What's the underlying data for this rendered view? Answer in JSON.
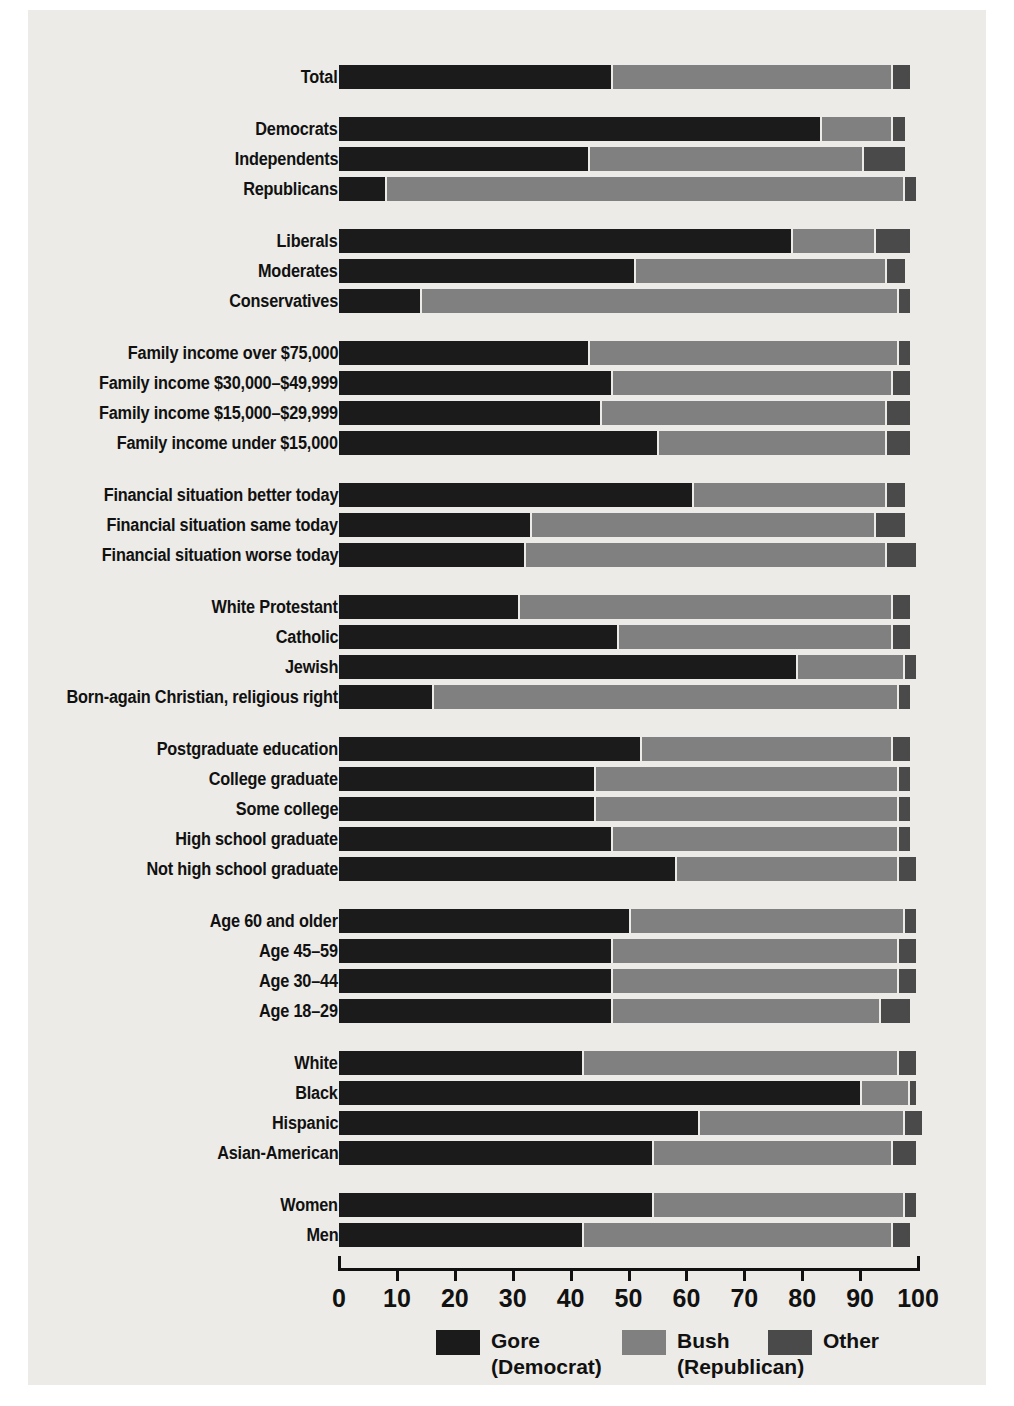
{
  "colors": {
    "gore": "#1b1b1b",
    "bush": "#808080",
    "other": "#4a4a4a",
    "page_background": "#ecebe7",
    "text": "#111111"
  },
  "legend": {
    "items": [
      {
        "name": "Gore",
        "sub": "(Democrat)",
        "color": "#1b1b1b"
      },
      {
        "name": "Bush",
        "sub": "(Republican)",
        "color": "#808080"
      },
      {
        "name": "Other",
        "sub": "",
        "color": "#4a4a4a"
      }
    ]
  },
  "axis": {
    "ticks": [
      "0",
      "10",
      "20",
      "30",
      "40",
      "50",
      "60",
      "70",
      "80",
      "90",
      "100"
    ],
    "min": 0,
    "max": 100
  },
  "chart_data": {
    "type": "bar",
    "orientation": "horizontal",
    "stacked": true,
    "title": "",
    "xlabel": "",
    "ylabel": "",
    "xlim": [
      0,
      100
    ],
    "grid": false,
    "legend_position": "bottom",
    "series": [
      {
        "name": "Gore (Democrat)",
        "color": "#1b1b1b"
      },
      {
        "name": "Bush (Republican)",
        "color": "#808080"
      },
      {
        "name": "Other",
        "color": "#4a4a4a"
      }
    ],
    "groups": [
      {
        "name": "total",
        "rows": [
          {
            "label": "Total",
            "values": [
              47,
              48,
              3
            ]
          }
        ]
      },
      {
        "name": "party",
        "rows": [
          {
            "label": "Democrats",
            "values": [
              83,
              12,
              2
            ]
          },
          {
            "label": "Independents",
            "values": [
              43,
              47,
              7
            ]
          },
          {
            "label": "Republicans",
            "values": [
              8,
              89,
              2
            ]
          }
        ]
      },
      {
        "name": "ideology",
        "rows": [
          {
            "label": "Liberals",
            "values": [
              78,
              14,
              6
            ]
          },
          {
            "label": "Moderates",
            "values": [
              51,
              43,
              3
            ]
          },
          {
            "label": "Conservatives",
            "values": [
              14,
              82,
              2
            ]
          }
        ]
      },
      {
        "name": "family-income",
        "rows": [
          {
            "label": "Family income over $75,000",
            "values": [
              43,
              53,
              2
            ]
          },
          {
            "label": "Family income $30,000–$49,999",
            "values": [
              47,
              48,
              3
            ]
          },
          {
            "label": "Family income $15,000–$29,999",
            "values": [
              45,
              49,
              4
            ]
          },
          {
            "label": "Family income under $15,000",
            "values": [
              55,
              39,
              4
            ]
          }
        ]
      },
      {
        "name": "financial-situation",
        "rows": [
          {
            "label": "Financial situation better today",
            "values": [
              61,
              33,
              3
            ]
          },
          {
            "label": "Financial situation same today",
            "values": [
              33,
              59,
              5
            ]
          },
          {
            "label": "Financial situation worse today",
            "values": [
              32,
              62,
              5
            ]
          }
        ]
      },
      {
        "name": "religion",
        "rows": [
          {
            "label": "White Protestant",
            "values": [
              31,
              64,
              3
            ]
          },
          {
            "label": "Catholic",
            "values": [
              48,
              47,
              3
            ]
          },
          {
            "label": "Jewish",
            "values": [
              79,
              18,
              2
            ]
          },
          {
            "label": "Born-again Christian, religious right",
            "values": [
              16,
              80,
              2
            ]
          }
        ]
      },
      {
        "name": "education",
        "rows": [
          {
            "label": "Postgraduate education",
            "values": [
              52,
              43,
              3
            ]
          },
          {
            "label": "College graduate",
            "values": [
              44,
              52,
              2
            ]
          },
          {
            "label": "Some college",
            "values": [
              44,
              52,
              2
            ]
          },
          {
            "label": "High school graduate",
            "values": [
              47,
              49,
              2
            ]
          },
          {
            "label": "Not high school graduate",
            "values": [
              58,
              38,
              3
            ]
          }
        ]
      },
      {
        "name": "age",
        "rows": [
          {
            "label": "Age 60 and older",
            "values": [
              50,
              47,
              2
            ]
          },
          {
            "label": "Age 45–59",
            "values": [
              47,
              49,
              3
            ]
          },
          {
            "label": "Age 30–44",
            "values": [
              47,
              49,
              3
            ]
          },
          {
            "label": "Age 18–29",
            "values": [
              47,
              46,
              5
            ]
          }
        ]
      },
      {
        "name": "race",
        "rows": [
          {
            "label": "White",
            "values": [
              42,
              54,
              3
            ]
          },
          {
            "label": "Black",
            "values": [
              90,
              8,
              1
            ]
          },
          {
            "label": "Hispanic",
            "values": [
              62,
              35,
              3
            ]
          },
          {
            "label": "Asian-American",
            "values": [
              54,
              41,
              4
            ]
          }
        ]
      },
      {
        "name": "gender",
        "rows": [
          {
            "label": "Women",
            "values": [
              54,
              43,
              2
            ]
          },
          {
            "label": "Men",
            "values": [
              42,
              53,
              3
            ]
          }
        ]
      }
    ]
  }
}
